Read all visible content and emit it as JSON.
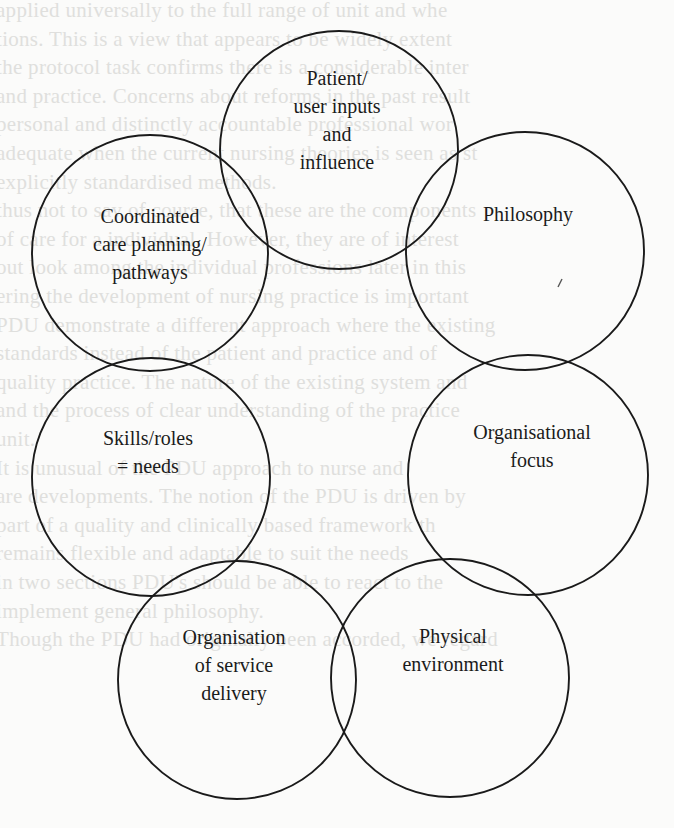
{
  "diagram": {
    "type": "overlapping-circles",
    "circles": [
      {
        "id": "patient",
        "lines": [
          "Patient/",
          "user inputs",
          "and",
          "influence"
        ],
        "cx": 339,
        "cy": 150,
        "r": 119,
        "label_x": 337,
        "label_y": 64
      },
      {
        "id": "philosophy",
        "lines": [
          "Philosophy"
        ],
        "cx": 525,
        "cy": 251,
        "r": 119,
        "label_x": 528,
        "label_y": 200
      },
      {
        "id": "coordinated",
        "lines": [
          "Coordinated",
          "care planning/",
          "pathways"
        ],
        "cx": 150,
        "cy": 253,
        "r": 118,
        "label_x": 150,
        "label_y": 202
      },
      {
        "id": "organisational-focus",
        "lines": [
          "Organisational",
          "focus"
        ],
        "cx": 528,
        "cy": 475,
        "r": 120,
        "label_x": 532,
        "label_y": 418
      },
      {
        "id": "skills",
        "lines": [
          "Skills/roles",
          "= needs"
        ],
        "cx": 151,
        "cy": 477,
        "r": 119,
        "label_x": 148,
        "label_y": 424
      },
      {
        "id": "physical-environment",
        "lines": [
          "Physical",
          "environment"
        ],
        "cx": 450,
        "cy": 678,
        "r": 119,
        "label_x": 453,
        "label_y": 622
      },
      {
        "id": "service-delivery",
        "lines": [
          "Organisation",
          "of service",
          "delivery"
        ],
        "cx": 237,
        "cy": 680,
        "r": 119,
        "label_x": 234,
        "label_y": 623
      }
    ],
    "stroke_color": "#1a1a1a",
    "stray_marks": [
      {
        "x1": 558,
        "y1": 287,
        "x2": 562,
        "y2": 279
      }
    ]
  },
  "bleed_text": {
    "lines": [
      "applied universally to the full range of unit and whe",
      "tions. This is a view that appears to be widely extent",
      "the protocol task confirms there is a considerable inter",
      "and practice. Concerns about reforms in the past result",
      "personal and distinctly accountable professional wor",
      "adequate when the current nursing theories is seen as st",
      "explicitly standardised methods.",
      "thus not to say of course, that these are the components",
      "of care for a individual. However, they are of interest",
      "out look among the individual professions later in this",
      "ering the development of nursing practice is important",
      "PDU demonstrate a different approach where the existing",
      "standards instead of the patient and practice and of",
      "quality practice. The nature of the existing system and",
      "and the process of clear understanding of the practice",
      "unit.",
      "It is unusual of the PDU approach to nurse and",
      "are developments. The notion of the PDU is driven by",
      "part of a quality and clinically based framework th",
      "remains flexible and adaptable to suit the needs",
      "in two sections PDU's should be able to react to the",
      "implement general philosophy.",
      "Though the PDU had originally been accorded, we regard"
    ],
    "start_y": -2,
    "line_height": 28.6
  }
}
